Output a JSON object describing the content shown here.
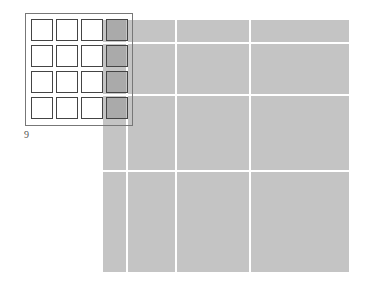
{
  "figure": {
    "label": "9",
    "large_grid": {
      "columns": [
        [
          103,
          23
        ],
        [
          128,
          47
        ],
        [
          177,
          72
        ],
        [
          251,
          98
        ]
      ],
      "rows": [
        [
          20,
          22
        ],
        [
          44,
          50
        ],
        [
          96,
          74
        ],
        [
          172,
          100
        ]
      ],
      "color": "#c4c4c4"
    },
    "small_grid": {
      "rows": 4,
      "cols": 4,
      "shaded_column": 4,
      "shade_color": "#a0a0a0"
    }
  }
}
